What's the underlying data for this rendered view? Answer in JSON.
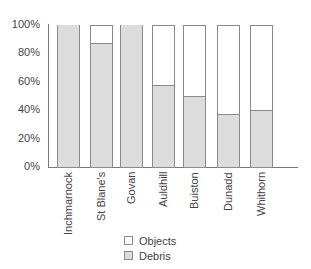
{
  "chart_data": {
    "type": "bar",
    "stacked": true,
    "normalized": true,
    "title": "",
    "xlabel": "",
    "ylabel": "",
    "ylim": [
      0,
      100
    ],
    "y_ticks": [
      "0%",
      "20%",
      "40%",
      "60%",
      "80%",
      "100%"
    ],
    "categories": [
      "Inchmarnock",
      "St Blane's",
      "Govan",
      "Auldhill",
      "Buiston",
      "Dunadd",
      "Whithorn"
    ],
    "series": [
      {
        "name": "Debris",
        "color": "#dcdcdc",
        "values": [
          100,
          87,
          100,
          58,
          50,
          37,
          40
        ]
      },
      {
        "name": "Objects",
        "color": "#ffffff",
        "values": [
          0,
          13,
          0,
          42,
          50,
          63,
          60
        ]
      }
    ],
    "legend": {
      "position": "bottom",
      "entries": [
        "Objects",
        "Debris"
      ]
    },
    "grid": false
  },
  "legend": {
    "items": [
      {
        "label": "Objects",
        "color": "#ffffff"
      },
      {
        "label": "Debris",
        "color": "#dcdcdc"
      }
    ]
  }
}
